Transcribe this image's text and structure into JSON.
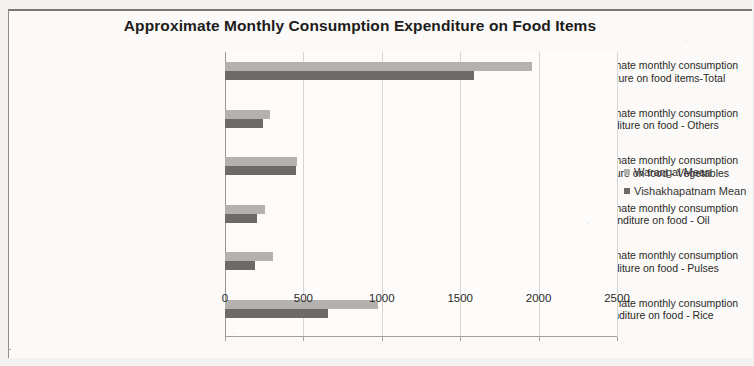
{
  "chart_data": {
    "type": "bar",
    "orientation": "horizontal",
    "title": "Approximate Monthly Consumption Expenditure on Food Items",
    "xlabel": "",
    "ylabel": "",
    "xlim": [
      0,
      2500
    ],
    "xticks": [
      "0",
      "500",
      "1000",
      "1500",
      "2000",
      "2500"
    ],
    "grid": true,
    "legend_position": "right",
    "categories": [
      "9. Approximate monthly consumption expenditure on food items-Total",
      "9. Approximate monthly consumption expenditure on food - Others",
      "9. Approximate monthly consumption expenditure on food - Vegetables",
      "9. Approximate monthly consumption expenditure on food - Oil",
      "9. Approximate monthly consumption expenditure on food - Pulses",
      "9. Approximate monthly consumption expenditure on food - Rice"
    ],
    "category_lines": [
      [
        "9. Approximate monthly consumption",
        "expenditure on food items-Total"
      ],
      [
        "9. Approximate monthly consumption",
        "expenditure on food - Others"
      ],
      [
        "9. Approximate monthly consumption",
        "expenditure on food - Vegetables"
      ],
      [
        "9. Approximate monthly consumption",
        "expenditure on food - Oil"
      ],
      [
        "9. Approximate monthly consumption",
        "expenditure on food - Pulses"
      ],
      [
        "9. Approximate monthly consumption",
        "expenditure on food - Rice"
      ]
    ],
    "series": [
      {
        "name": "Warangal Mean",
        "color": "#b4b2ae",
        "values": [
          1955,
          288,
          460,
          256,
          307,
          975
        ]
      },
      {
        "name": "Vishakhapatnam Mean",
        "color": "#6d6b68",
        "values": [
          1590,
          243,
          450,
          205,
          192,
          660
        ]
      }
    ]
  }
}
